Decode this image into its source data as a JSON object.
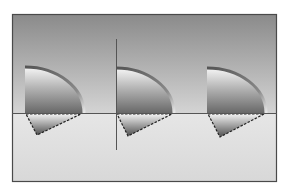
{
  "diagram": {
    "frame": {
      "x": 12,
      "y": 14,
      "width": 265,
      "height": 168,
      "border_color": "#4a4a4a"
    },
    "sky": {
      "top_color": "#8c8c8c",
      "bottom_color": "#d2d2d2"
    },
    "ground": {
      "top_color": "#e4e4e4",
      "bottom_color": "#d6d6d6"
    },
    "horizon_y": 113,
    "horizon_color": "#555555",
    "vertical_line": {
      "x": 116,
      "y1": 39,
      "y2": 150,
      "color": "#555555"
    },
    "shapes": [
      {
        "id": "fin-left",
        "x": 25,
        "top": 67,
        "tip_x": 84,
        "apex_x": 37,
        "apex_y": 135
      },
      {
        "id": "fin-middle",
        "x": 116,
        "top": 68,
        "tip_x": 174,
        "apex_x": 128,
        "apex_y": 136
      },
      {
        "id": "fin-right",
        "x": 207,
        "top": 68,
        "tip_x": 266,
        "apex_x": 220,
        "apex_y": 137
      }
    ],
    "colors": {
      "rim_dark": "#5a5a5a",
      "rim_light": "#f0f0f0",
      "fill_top": "#f4f4f4",
      "fill_bottom": "#6a6a6a",
      "dash": "#222222"
    }
  }
}
